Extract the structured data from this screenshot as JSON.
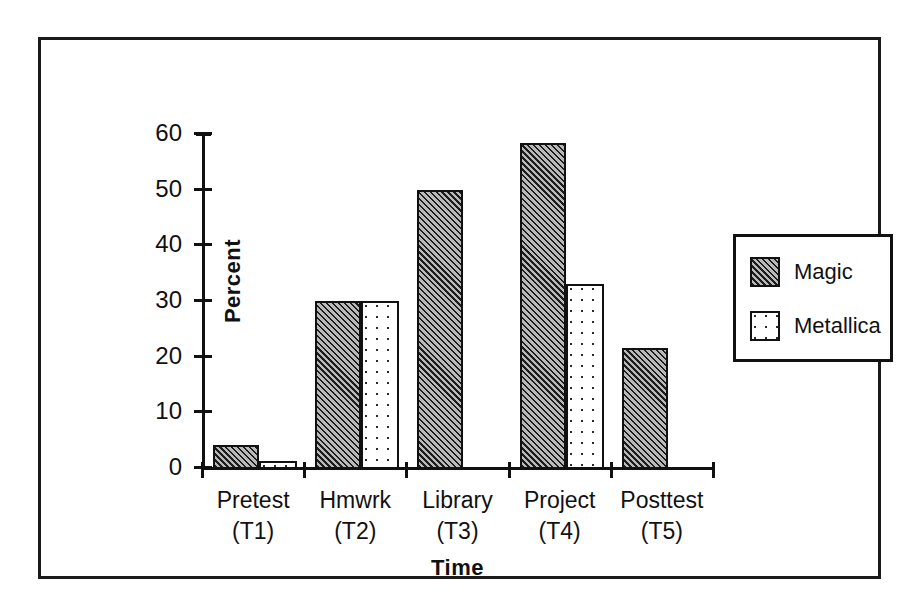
{
  "chart_data": {
    "type": "bar",
    "title": "",
    "subtitle": "",
    "xlabel": "Time",
    "ylabel": "Percent",
    "categories": [
      "Pretest (T1)",
      "Hmwrk (T2)",
      "Library (T3)",
      "Project (T4)",
      "Posttest (T5)"
    ],
    "category_lines": [
      {
        "line1": "Pretest",
        "line2": "(T1)"
      },
      {
        "line1": "Hmwrk",
        "line2": "(T2)"
      },
      {
        "line1": "Library",
        "line2": "(T3)"
      },
      {
        "line1": "Project",
        "line2": "(T4)"
      },
      {
        "line1": "Posttest",
        "line2": "(T5)"
      }
    ],
    "series": [
      {
        "name": "Magic",
        "pattern": "diagonal-hatch",
        "values": [
          4.3,
          30.2,
          50.2,
          58.6,
          21.7
        ]
      },
      {
        "name": "Metallica",
        "pattern": "dotted",
        "values": [
          1.4,
          30.2,
          0,
          33.2,
          0
        ]
      }
    ],
    "ylim": [
      0,
      60
    ],
    "yticks": [
      0,
      10,
      20,
      30,
      40,
      50,
      60
    ],
    "ytick_labels": [
      "0",
      "10",
      "20",
      "30",
      "40",
      "50",
      "60"
    ],
    "grid": false,
    "legend_position": "right",
    "legend_entries": [
      "Magic",
      "Metallica"
    ],
    "colors": {
      "axis": "#111111",
      "frame": "#1a1a1a",
      "magic_fill": "#b9b9b9",
      "metallica_fill": "#ffffff",
      "background": "#ffffff"
    }
  }
}
